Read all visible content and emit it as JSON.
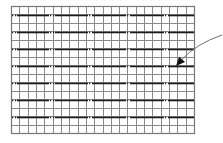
{
  "diagram": {
    "type": "grid-with-pointer",
    "grid": {
      "x": 11,
      "y": 6,
      "width": 183,
      "height": 127,
      "columns": 22,
      "rows": 15,
      "thin_line_color": "#8a8a8a",
      "major_line_color": "#1a1a1a",
      "border_color": "#777777",
      "major_rows_y": [
        15,
        32,
        49,
        66,
        83,
        100,
        117
      ],
      "major_vertical_x": [],
      "dash_gap_x": [
        {
          "start": 11,
          "end": 17
        },
        {
          "start": 49,
          "end": 55
        },
        {
          "start": 88,
          "end": 93
        },
        {
          "start": 126,
          "end": 131
        },
        {
          "start": 164,
          "end": 169
        }
      ]
    },
    "pointer": {
      "start": [
        222,
        35
      ],
      "control": [
        196,
        44
      ],
      "tip": [
        176,
        66
      ],
      "color": "#707070",
      "head_color": "#111111"
    }
  }
}
